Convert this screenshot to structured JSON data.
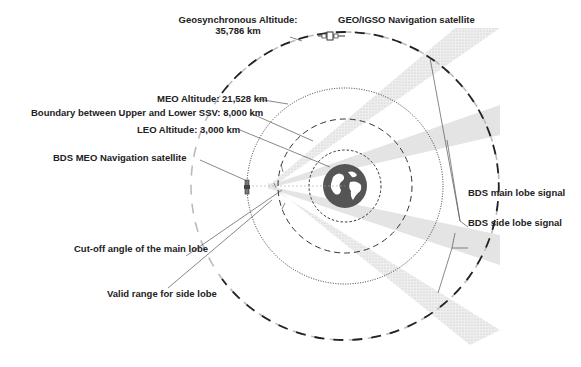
{
  "diagram": {
    "labels": {
      "geo_altitude": "Geosynchronous Altitude:",
      "geo_altitude_value": "35,786 km",
      "geo_satellite": "GEO/IGSO Navigation satellite",
      "meo_altitude": "MEO Altitude: 21,528 km",
      "ssv_boundary": "Boundary between Upper and Lower SSV: 8,000 km",
      "leo_altitude": "LEO Altitude: 3,000 km",
      "meo_satellite": "BDS MEO Navigation satellite",
      "main_lobe": "BDS main lobe signal",
      "side_lobe": "BDS side lobe signal",
      "cutoff_angle": "Cut-off angle of the main lobe",
      "valid_side_lobe": "Valid range for side lobe"
    },
    "orbits": [
      {
        "name": "LEO",
        "altitude_km": 3000,
        "style": "dashed-fine"
      },
      {
        "name": "SSV boundary",
        "altitude_km": 8000,
        "style": "dashed"
      },
      {
        "name": "MEO",
        "altitude_km": 21528,
        "style": "dotted"
      },
      {
        "name": "GEO",
        "altitude_km": 35786,
        "style": "dashed-bold"
      }
    ],
    "colors": {
      "ink": "#222222",
      "main_lobe_fill": "#d9d9d9",
      "side_lobe_fill": "#e6e6e6",
      "earth": "#555555"
    }
  }
}
